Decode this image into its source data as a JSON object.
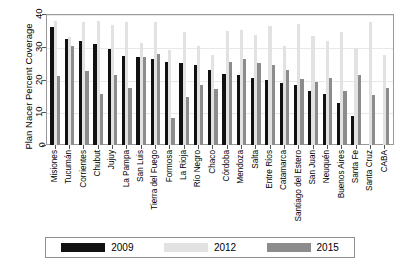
{
  "chart_data": {
    "type": "bar",
    "title": "",
    "xlabel": "",
    "ylabel": "Plan Nacer Percent Coverage",
    "ylim": [
      0,
      40
    ],
    "yticks": [
      0,
      10,
      20,
      30,
      40
    ],
    "grid": true,
    "legend_position": "bottom",
    "categories": [
      "Misiones",
      "Tucumán",
      "Corrientes",
      "Chubut",
      "Jujuy",
      "La Pampa",
      "San Luis",
      "Tierra del Fuego",
      "Formosa",
      "La Rioja",
      "Río Negro",
      "Chaco",
      "Córdoba",
      "Mendoza",
      "Salta",
      "Entre Ríos",
      "Catamarca",
      "Santiago del Estero",
      "San Juan",
      "Neuquén",
      "Buenos Aires",
      "Santa Fe",
      "Santa Cruz",
      "CABA"
    ],
    "series": [
      {
        "name": "2009",
        "color": "#111111",
        "values": [
          36.0,
          32.5,
          31.9,
          30.9,
          29.2,
          27.3,
          26.8,
          26.4,
          25.2,
          25.0,
          24.4,
          23.0,
          21.8,
          21.5,
          20.4,
          19.7,
          18.8,
          18.4,
          16.5,
          15.6,
          12.7,
          8.9,
          0.0,
          0.0
        ]
      },
      {
        "name": "2012",
        "color": "#e2e2e2",
        "values": [
          37.8,
          33.1,
          37.7,
          37.8,
          36.6,
          37.6,
          31.0,
          37.6,
          28.9,
          34.4,
          30.3,
          27.5,
          34.9,
          35.0,
          33.6,
          36.4,
          30.2,
          37.1,
          33.3,
          31.7,
          34.6,
          29.6,
          37.7,
          27.6
        ]
      },
      {
        "name": "2015",
        "color": "#8c8c8c",
        "values": [
          21.1,
          30.1,
          22.5,
          15.7,
          21.4,
          17.4,
          26.9,
          27.8,
          8.3,
          14.8,
          18.2,
          17.2,
          25.3,
          26.3,
          25.1,
          24.3,
          22.9,
          20.2,
          19.1,
          20.6,
          16.4,
          21.5,
          15.4,
          17.3
        ]
      }
    ],
    "legend": [
      {
        "label": "2009",
        "color": "#111111"
      },
      {
        "label": "2012",
        "color": "#e2e2e2"
      },
      {
        "label": "2015",
        "color": "#8c8c8c"
      }
    ]
  }
}
